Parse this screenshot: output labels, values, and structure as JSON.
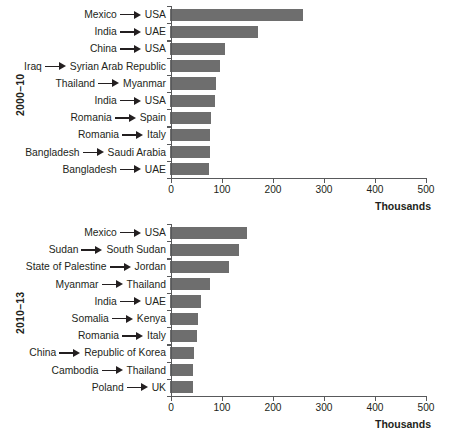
{
  "figure": {
    "bar_color": "#6e6e6e",
    "axis_color": "#58595b",
    "text_color": "#231f20",
    "background": "#ffffff"
  },
  "chart_data": [
    {
      "type": "bar",
      "orientation": "horizontal",
      "panel_id": "2000-10",
      "title": "",
      "period_label": "2000–10",
      "xlabel": "Thousands",
      "ylabel": "",
      "xlim": [
        0,
        500
      ],
      "xticks": [
        0,
        100,
        200,
        300,
        400,
        500
      ],
      "xtick_labels": [
        "0",
        "100",
        "200",
        "300",
        "400",
        "500"
      ],
      "grid": false,
      "legend": null,
      "units": "thousands of people",
      "categories": [
        "Mexico → USA",
        "India → UAE",
        "China → USA",
        "Iraq → Syrian Arab Republic",
        "Thailand → Myanmar",
        "India → USA",
        "Romania → Spain",
        "Romania → Italy",
        "Bangladesh → Saudi Arabia",
        "Bangladesh → UAE"
      ],
      "corridors": [
        {
          "origin": "Mexico",
          "destination": "USA",
          "value": 260
        },
        {
          "origin": "India",
          "destination": "UAE",
          "value": 173
        },
        {
          "origin": "China",
          "destination": "USA",
          "value": 107
        },
        {
          "origin": "Iraq",
          "destination": "Syrian Arab Republic",
          "value": 99
        },
        {
          "origin": "Thailand",
          "destination": "Myanmar",
          "value": 90
        },
        {
          "origin": "India",
          "destination": "USA",
          "value": 89
        },
        {
          "origin": "Romania",
          "destination": "Spain",
          "value": 80
        },
        {
          "origin": "Romania",
          "destination": "Italy",
          "value": 79
        },
        {
          "origin": "Bangladesh",
          "destination": "Saudi Arabia",
          "value": 79
        },
        {
          "origin": "Bangladesh",
          "destination": "UAE",
          "value": 77
        }
      ],
      "values": [
        260,
        173,
        107,
        99,
        90,
        89,
        80,
        79,
        79,
        77
      ]
    },
    {
      "type": "bar",
      "orientation": "horizontal",
      "panel_id": "2010-13",
      "title": "",
      "period_label": "2010–13",
      "xlabel": "Thousands",
      "ylabel": "",
      "xlim": [
        0,
        500
      ],
      "xticks": [
        0,
        100,
        200,
        300,
        400,
        500
      ],
      "xtick_labels": [
        "0",
        "100",
        "200",
        "300",
        "400",
        "500"
      ],
      "grid": false,
      "legend": null,
      "units": "thousands of people",
      "categories": [
        "Mexico → USA",
        "Sudan → South Sudan",
        "State of Palestine → Jordan",
        "Myanmar → Thailand",
        "India → UAE",
        "Somalia → Kenya",
        "Romania → Italy",
        "China → Republic of Korea",
        "Cambodia → Thailand",
        "Poland → UK"
      ],
      "corridors": [
        {
          "origin": "Mexico",
          "destination": "USA",
          "value": 150
        },
        {
          "origin": "Sudan",
          "destination": "South Sudan",
          "value": 136
        },
        {
          "origin": "State of Palestine",
          "destination": "Jordan",
          "value": 115
        },
        {
          "origin": "Myanmar",
          "destination": "Thailand",
          "value": 78
        },
        {
          "origin": "India",
          "destination": "UAE",
          "value": 60
        },
        {
          "origin": "Somalia",
          "destination": "Kenya",
          "value": 54
        },
        {
          "origin": "Romania",
          "destination": "Italy",
          "value": 52
        },
        {
          "origin": "China",
          "destination": "Republic of Korea",
          "value": 48
        },
        {
          "origin": "Cambodia",
          "destination": "Thailand",
          "value": 46
        },
        {
          "origin": "Poland",
          "destination": "UK",
          "value": 45
        }
      ],
      "values": [
        150,
        136,
        115,
        78,
        60,
        54,
        52,
        48,
        46,
        45
      ]
    }
  ],
  "icons": {
    "arrow": "arrow-right-icon"
  }
}
